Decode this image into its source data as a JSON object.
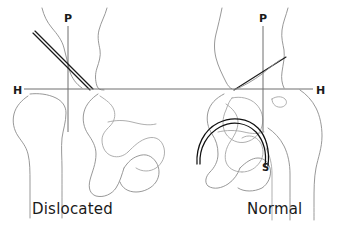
{
  "figure": {
    "background_color": "#ffffff",
    "line_color": "#8c8c8c",
    "reference_line_color": "#6e6e6e",
    "angle_line_color": "#1a1a1a",
    "width": 338,
    "height": 225
  },
  "panels": {
    "left": {
      "caption": "Dislocated",
      "perkins_label": "P",
      "hilgenreiner_label": "H"
    },
    "right": {
      "caption": "Normal",
      "perkins_label": "P",
      "hilgenreiner_label": "H",
      "shenton_label": "S"
    }
  },
  "annotations": {
    "hilgenreiner_line_y": 89,
    "left_perkins_x": 68,
    "right_perkins_x": 263,
    "left_acetabular_angle_start": [
      33,
      33
    ],
    "left_acetabular_angle_end": [
      90,
      90
    ],
    "right_acetabular_angle_start": [
      234,
      90
    ],
    "right_acetabular_angle_end": [
      286,
      57
    ]
  }
}
